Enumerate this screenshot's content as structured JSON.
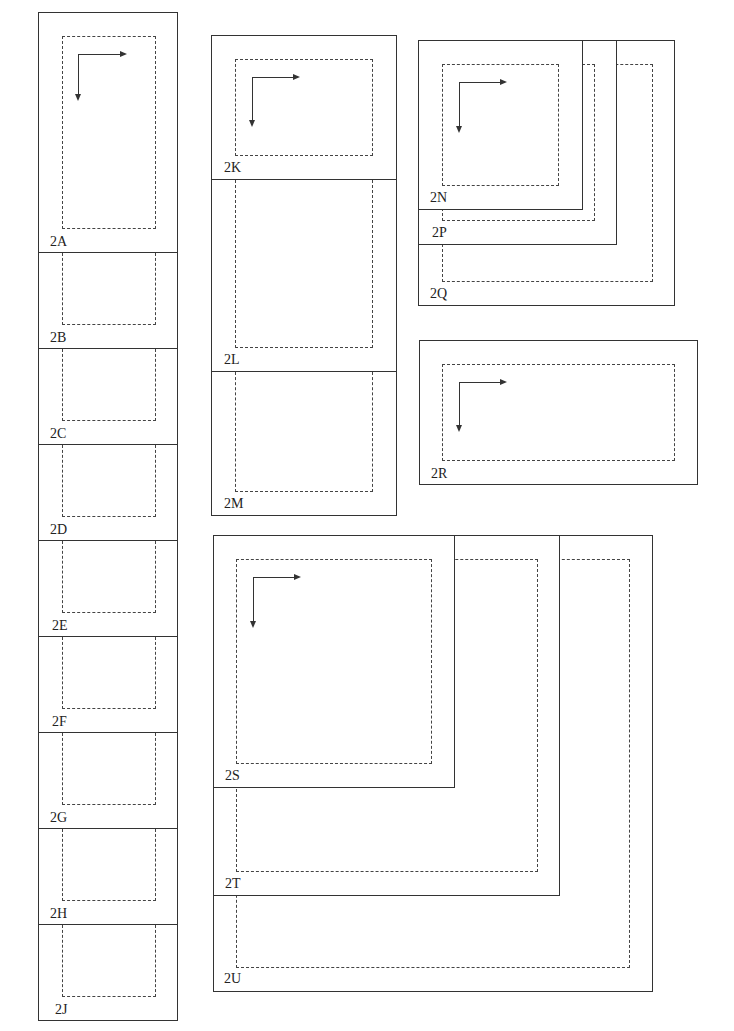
{
  "diagram": {
    "type": "layout-frame-diagram",
    "left_column": {
      "labels": [
        "2A",
        "2B",
        "2C",
        "2D",
        "2E",
        "2F",
        "2G",
        "2H",
        "2J"
      ]
    },
    "middle_column": {
      "labels": [
        "2K",
        "2L",
        "2M"
      ]
    },
    "nested_group_1": {
      "labels": [
        "2N",
        "2P",
        "2Q"
      ]
    },
    "single_frame": {
      "labels": [
        "2R"
      ]
    },
    "nested_group_2": {
      "labels": [
        "2S",
        "2T",
        "2U"
      ]
    },
    "icons": {
      "direction_arrow": "corner-arrow-right-down-icon"
    },
    "colors": {
      "line": "#333333",
      "dashed": "#444444",
      "text": "#222222",
      "background": "#ffffff"
    }
  }
}
